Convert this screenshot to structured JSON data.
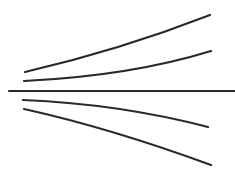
{
  "diagram": {
    "type": "line-drawing",
    "stroke_color": "#2a2a2a",
    "background": "#ffffff",
    "axis": {
      "x1": 9,
      "y1": 91,
      "x2": 235,
      "y2": 91,
      "width": 2.2
    },
    "curves": [
      {
        "name": "upper-outer-curve",
        "d": "M25,72 Q120,50 210,15",
        "width": 2.2
      },
      {
        "name": "upper-inner-curve",
        "d": "M24,81 Q130,76 211,51",
        "width": 2.2
      },
      {
        "name": "lower-inner-curve",
        "d": "M23,100 Q120,104 208,127",
        "width": 2.2
      },
      {
        "name": "lower-outer-curve",
        "d": "M24,109 Q110,128 211,165",
        "width": 2.2
      }
    ]
  }
}
